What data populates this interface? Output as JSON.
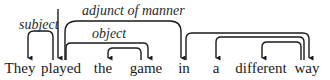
{
  "diagram": {
    "type": "dependency-parse",
    "colors": {
      "ink": "#1a1a1a",
      "background": "#ffffff"
    },
    "words": [
      {
        "text": "They",
        "x": 20
      },
      {
        "text": "played",
        "x": 60
      },
      {
        "text": "the",
        "x": 103
      },
      {
        "text": "game",
        "x": 146
      },
      {
        "text": "in",
        "x": 184
      },
      {
        "text": "a",
        "x": 216
      },
      {
        "text": "different",
        "x": 261
      },
      {
        "text": "way",
        "x": 307
      }
    ],
    "labels": {
      "subject": "subject",
      "object": "object",
      "adjunct": "adjunct of manner"
    },
    "arcs": [
      {
        "from": "ROOT",
        "to": "played",
        "label": ""
      },
      {
        "from": "played",
        "to": "They",
        "label": "subject"
      },
      {
        "from": "played",
        "to": "in",
        "label": "adjunct of manner"
      },
      {
        "from": "played",
        "to": "game",
        "label": "object"
      },
      {
        "from": "game",
        "to": "the",
        "label": ""
      },
      {
        "from": "in",
        "to": "way",
        "label": ""
      },
      {
        "from": "way",
        "to": "a",
        "label": ""
      },
      {
        "from": "way",
        "to": "different",
        "label": ""
      }
    ]
  }
}
